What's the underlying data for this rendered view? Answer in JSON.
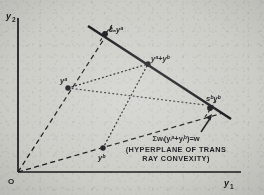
{
  "figure": {
    "kind": "geometric-diagram",
    "background_color": "#cdcdc8",
    "ink_color": "#16161a"
  },
  "axes": {
    "y_axis_label": "y",
    "y_axis_sub": "2",
    "x_axis_label": "y",
    "x_axis_sub": "1",
    "origin_label": "O"
  },
  "points": [
    {
      "id": "sa-ya",
      "label_base": "s",
      "label_sub": "a",
      "label_var": "y",
      "label_sup": "a",
      "x": 105,
      "y": 34
    },
    {
      "id": "ya",
      "label_base": "",
      "label_sub": "",
      "label_var": "y",
      "label_sup": "a",
      "x": 68,
      "y": 88
    },
    {
      "id": "yb",
      "label_base": "",
      "label_sub": "",
      "label_var": "y",
      "label_sup": "b",
      "x": 103,
      "y": 148
    },
    {
      "id": "sb-yb",
      "label_base": "s",
      "label_sub": "b",
      "label_var": "y",
      "label_sup": "b",
      "x": 210,
      "y": 108
    },
    {
      "id": "ya-plus-yb",
      "label_base": "",
      "label_sub": "",
      "label_var": "y",
      "label_sup": "a+b",
      "x": 148,
      "y": 64
    }
  ],
  "point_labels": {
    "sa_ya": "sₐyᵃ",
    "ya": "yᵃ",
    "yb": "yᵇ",
    "sb_yb": "sᵇyᵇ",
    "ya_plus_yb": "yᵃ+yᵇ"
  },
  "annotation": {
    "equation": "Σwᵢ(yᵢᵃ+yᵢᵇ)=w",
    "caption_line1": "(HYPERPLANE OF TRANS",
    "caption_line2": "RAY CONVEXITY)"
  },
  "lines": {
    "hyperplane": {
      "style": "solid",
      "x1": 88,
      "y1": 26,
      "x2": 230,
      "y2": 118
    },
    "ray_a": {
      "style": "dashed",
      "x1": 18,
      "y1": 172,
      "x2": 113,
      "y2": 25
    },
    "ray_b": {
      "style": "dashed",
      "x1": 18,
      "y1": 172,
      "x2": 222,
      "y2": 113
    },
    "dotted_a": {
      "style": "dotted",
      "x1": 68,
      "y1": 88,
      "x2": 148,
      "y2": 64
    },
    "dotted_b": {
      "style": "dotted",
      "x1": 103,
      "y1": 148,
      "x2": 148,
      "y2": 64
    }
  }
}
